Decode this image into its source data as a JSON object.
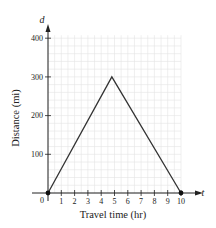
{
  "chart_data": {
    "type": "line",
    "title": "",
    "xlabel": "Travel time (hr)",
    "ylabel": "Distance (mi)",
    "x_axis_variable": "t",
    "y_axis_variable": "d",
    "origin_label": "0",
    "x_ticks": [
      1,
      2,
      3,
      4,
      5,
      6,
      7,
      8,
      9,
      10
    ],
    "y_ticks": [
      100,
      200,
      300,
      400
    ],
    "xlim": [
      0,
      10
    ],
    "ylim": [
      0,
      400
    ],
    "grid": true,
    "legend": null,
    "series": [
      {
        "name": "distance",
        "points": [
          {
            "x": 0,
            "y": 0,
            "marker": true
          },
          {
            "x": 4.8,
            "y": 300,
            "marker": false
          },
          {
            "x": 10,
            "y": 0,
            "marker": true
          }
        ]
      }
    ],
    "colors": {
      "line": "#333333",
      "grid": "#e4e4e4",
      "axis": "#222222"
    }
  }
}
